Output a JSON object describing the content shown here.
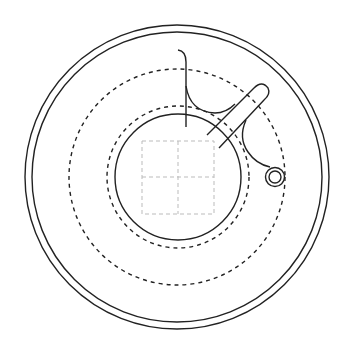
{
  "diagram": {
    "title": "",
    "type": "technical-line-drawing",
    "colors": {
      "background": "#ffffff",
      "stroke": "#222222",
      "grid": "#bbbbbb"
    },
    "elements": [
      {
        "id": "outer-rim-outer",
        "shape": "circle",
        "style": "solid"
      },
      {
        "id": "outer-rim-inner",
        "shape": "circle",
        "style": "solid"
      },
      {
        "id": "outer-dashed-circle",
        "shape": "circle",
        "style": "dashed"
      },
      {
        "id": "inner-dashed-circle",
        "shape": "circle",
        "style": "dashed"
      },
      {
        "id": "inner-solid-circle",
        "shape": "circle",
        "style": "solid"
      },
      {
        "id": "center-grid",
        "shape": "2x2 grid",
        "style": "dashed-light"
      },
      {
        "id": "vertical-hook-line",
        "shape": "curved line",
        "style": "solid"
      },
      {
        "id": "diagonal-slot",
        "shape": "rounded slot",
        "style": "solid"
      },
      {
        "id": "fillet-arcs",
        "shape": "arcs",
        "style": "solid"
      },
      {
        "id": "small-ring",
        "shape": "double circle",
        "style": "solid"
      }
    ]
  }
}
